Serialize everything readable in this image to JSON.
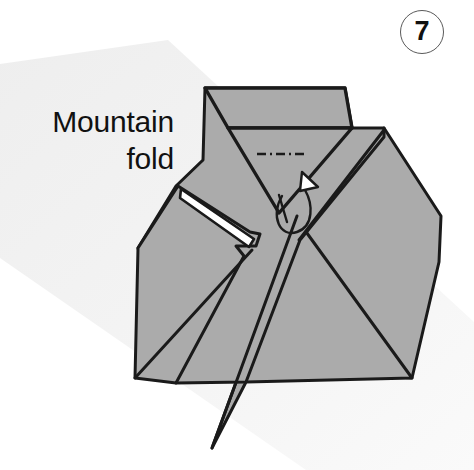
{
  "figure": {
    "kind": "origami-instruction-diagram",
    "step_label": "7",
    "annotation": {
      "text": "Mountain\nfold",
      "line_1": "Mountain",
      "line_2": "fold",
      "align": "right"
    },
    "colors": {
      "paper_front": "#ababab",
      "paper_back": "#ffffff",
      "outline": "#1a1a1a",
      "crease": "#1a1a1a",
      "background": "#ffffff",
      "background_band": "#f1f1f1",
      "text": "#111111",
      "badge_border": "#5a5a5a"
    },
    "symbols": [
      {
        "name": "mountain-fold-crease-line",
        "style": "dash-dot",
        "description": "short horizontal dash-dot line across the V-neck indicating the mountain fold"
      },
      {
        "name": "mountain-fold-arrow",
        "style": "hook-curve-with-hollow-arrowhead",
        "description": "curved arrow looping down and back up with an open white triangular head, the standard mountain-fold (fold behind) arrow"
      },
      {
        "name": "white-paper-sliver",
        "style": "filled-white-wedge",
        "description": "thin white wedge on the left flap showing the reverse side of the paper"
      }
    ],
    "shapes": {
      "background_band": "M0,68 L160,44 L474,330 L474,470 L300,470 L0,250 Z",
      "main_body": "M205,88 L345,88 L352,128 L384,128 L384,137 L440,215 L438,262 L410,378 L242,380 L212,448 L176,383 L135,378 L138,246 L176,186 L203,160 Z",
      "collar_band_outer": "M205,88 L345,88 L352,128 L228,128 Z",
      "collar_band_inner_left": "M205,88 L228,128",
      "collar_band_inner_right": "M345,88 L352,128",
      "v_neck": "M228,128 L352,128 L278,212 Z",
      "left_flap": "M178,186 L248,230 L258,232 L254,244 L236,244 L242,252 L176,383 L135,378 Z",
      "left_flap_fold_edge": "M178,186 L254,244",
      "white_sliver": "M180,190 L252,240 L247,246 L179,198 Z",
      "right_panel": "M384,128 L440,215 L438,262 L410,378 L330,372 L300,240 Z",
      "right_panel_edge": "M384,128 L300,240",
      "body_center_crease": "M296,218 L212,448",
      "lower_left_crease": "M250,252 L135,378",
      "mountain_dash_line": "M258,154 L303,154",
      "arrow_path": "M283,196 C272,214 278,236 295,232 C312,228 314,206 306,192",
      "arrow_head": "M303,174 L317,187 L301,190 Z"
    }
  }
}
